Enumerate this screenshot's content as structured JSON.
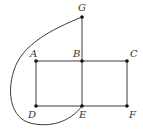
{
  "diagram": {
    "type": "graph",
    "nodes": [
      {
        "id": "G",
        "label": "G",
        "x": 82,
        "y": 17,
        "lx": 78,
        "ly": 11
      },
      {
        "id": "A",
        "label": "A",
        "x": 36,
        "y": 61,
        "lx": 30,
        "ly": 57
      },
      {
        "id": "B",
        "label": "B",
        "x": 82,
        "y": 61,
        "lx": 73,
        "ly": 57
      },
      {
        "id": "C",
        "label": "C",
        "x": 127,
        "y": 61,
        "lx": 130,
        "ly": 57
      },
      {
        "id": "D",
        "label": "D",
        "x": 36,
        "y": 106,
        "lx": 28,
        "ly": 118
      },
      {
        "id": "E",
        "label": "E",
        "x": 82,
        "y": 106,
        "lx": 79,
        "ly": 118
      },
      {
        "id": "F",
        "label": "F",
        "x": 127,
        "y": 106,
        "lx": 129,
        "ly": 118
      }
    ],
    "edges": [
      {
        "from": "G",
        "to": "B",
        "kind": "straight"
      },
      {
        "from": "A",
        "to": "B",
        "kind": "straight"
      },
      {
        "from": "B",
        "to": "C",
        "kind": "straight"
      },
      {
        "from": "A",
        "to": "D",
        "kind": "straight"
      },
      {
        "from": "B",
        "to": "E",
        "kind": "straight"
      },
      {
        "from": "C",
        "to": "F",
        "kind": "straight"
      },
      {
        "from": "D",
        "to": "E",
        "kind": "straight"
      },
      {
        "from": "E",
        "to": "F",
        "kind": "straight"
      },
      {
        "from": "G",
        "to": "E",
        "kind": "curved"
      }
    ],
    "colors": {
      "edge": "#3a3a3a",
      "node": "#111111",
      "label": "#333333"
    }
  }
}
